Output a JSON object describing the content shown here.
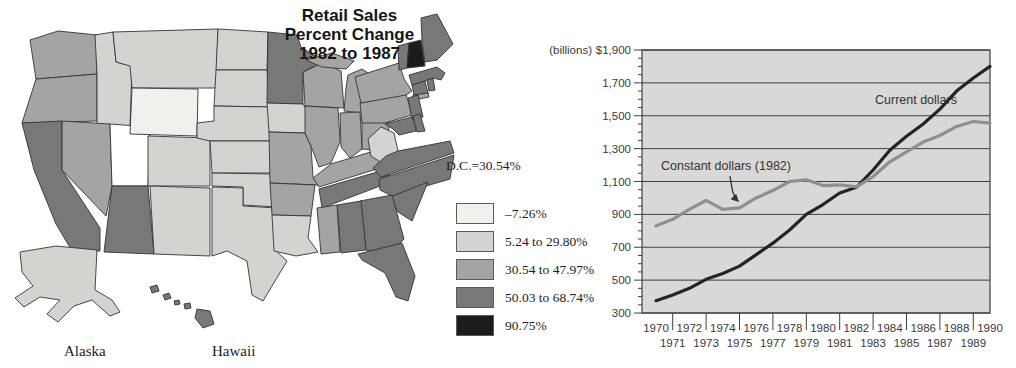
{
  "map": {
    "title_lines": [
      "Retail Sales",
      "Percent Change",
      "1982 to 1987"
    ],
    "dc_label": "D.C.=30.54%",
    "alaska_label": "Alaska",
    "hawaii_label": "Hawaii",
    "border_color": "#333333",
    "legend": [
      {
        "label": "–7.26%",
        "color": "#f0f0ed"
      },
      {
        "label": "5.24 to 29.80%",
        "color": "#d3d3d0"
      },
      {
        "label": "30.54 to 47.97%",
        "color": "#a4a4a2"
      },
      {
        "label": "50.03 to 68.74%",
        "color": "#787876"
      },
      {
        "label": "90.75%",
        "color": "#1c1c1c"
      }
    ],
    "states": {
      "wa": 2,
      "or": 2,
      "ca": 3,
      "id": 1,
      "nv": 2,
      "ut": "white",
      "az": 3,
      "mt": 1,
      "wy": 0,
      "co": 1,
      "nm": 1,
      "nd": 1,
      "sd": 1,
      "ne": 1,
      "ks": 1,
      "ok": 1,
      "tx": 1,
      "mn": 3,
      "ia": 1,
      "mo": 2,
      "ar": 2,
      "la": 1,
      "wi": 2,
      "il": 2,
      "mi": 2,
      "in": 2,
      "oh": 2,
      "ky": 2,
      "tn": 3,
      "ms": 2,
      "al": 3,
      "ga": 3,
      "fl": 3,
      "sc": 3,
      "nc": 3,
      "va": 3,
      "wv": 1,
      "md": 3,
      "de": 3,
      "nj": 3,
      "pa": 2,
      "ny": 2,
      "li": 2,
      "ct": 3,
      "ri": 3,
      "ma": 3,
      "vt": 3,
      "nh": 4,
      "me": 3,
      "ak": 1,
      "hi": 3
    }
  },
  "chart_data": {
    "type": "line",
    "billions_label": "(billions)",
    "x": [
      1970,
      1971,
      1972,
      1973,
      1974,
      1975,
      1976,
      1977,
      1978,
      1979,
      1980,
      1981,
      1982,
      1983,
      1984,
      1985,
      1986,
      1987,
      1988,
      1989,
      1990
    ],
    "ylim": [
      300,
      1900
    ],
    "minor_tick_step": 50,
    "grid": true,
    "plot_bg": "#d8d8d6",
    "grid_color": "#3f3f3f",
    "y_ticks": {
      "values": [
        1900,
        1700,
        1500,
        1300,
        1100,
        900,
        700,
        500,
        300
      ],
      "labels": [
        "$1,900",
        "1,700",
        "1,500",
        "1,300",
        "1,100",
        "900",
        "700",
        "500",
        "300"
      ]
    },
    "series": [
      {
        "name": "Current dollars",
        "color": "#242424",
        "values": [
          375,
          410,
          450,
          505,
          540,
          585,
          655,
          725,
          805,
          900,
          960,
          1030,
          1065,
          1170,
          1290,
          1375,
          1450,
          1540,
          1650,
          1730,
          1800
        ]
      },
      {
        "name": "Constant dollars (1982)",
        "color": "#8f8f8f",
        "values": [
          830,
          870,
          930,
          985,
          930,
          940,
          1000,
          1045,
          1100,
          1110,
          1075,
          1080,
          1068,
          1130,
          1220,
          1280,
          1340,
          1380,
          1435,
          1465,
          1455
        ]
      }
    ]
  }
}
